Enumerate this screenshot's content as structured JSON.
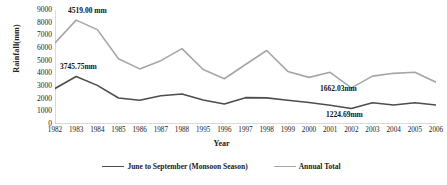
{
  "chart_data": {
    "type": "line",
    "title": "",
    "xlabel": "Year",
    "ylabel": "Rainfall(mm)",
    "ylim": [
      0,
      9000
    ],
    "ytick_step": 1000,
    "yticks": [
      "9000",
      "8000",
      "7000",
      "6000",
      "5000",
      "4000",
      "3000",
      "2000",
      "1000",
      "0"
    ],
    "grid": false,
    "legend_position": "bottom",
    "categories": [
      "1982",
      "1983",
      "1984",
      "1985",
      "1986",
      "1987",
      "1988",
      "1995",
      "1996",
      "1997",
      "1998",
      "1999",
      "2000",
      "2001",
      "2002",
      "2003",
      "2004",
      "2005",
      "2006"
    ],
    "series": [
      {
        "name": "June to September (Monsoon Season)",
        "color": "#4d4d4d",
        "values": [
          2800,
          3745.75,
          3050,
          2050,
          1880,
          2230,
          2370,
          1900,
          1580,
          2080,
          2060,
          1880,
          1700,
          1480,
          1224.69,
          1680,
          1500,
          1680,
          1500
        ]
      },
      {
        "name": "Annual Total",
        "color": "#a6a6a6",
        "values": [
          6400,
          8200,
          7450,
          5150,
          4350,
          5000,
          5950,
          4300,
          3570,
          4700,
          5800,
          4150,
          3680,
          4080,
          2850,
          3780,
          4000,
          4080,
          3300
        ]
      }
    ],
    "annotations": [
      {
        "name": "annual-peak-label",
        "text": "4519.00 mm",
        "x_px": 68,
        "y_px": 6
      },
      {
        "name": "monsoon-peak-label",
        "text": "3745.75mm",
        "x_px": 60,
        "y_px": 62
      },
      {
        "name": "annual-min-label",
        "text": "1662.03mm",
        "x_px": 320,
        "y_px": 84
      },
      {
        "name": "monsoon-min-label",
        "text": "1224.69mm",
        "x_px": 326,
        "y_px": 110
      }
    ]
  },
  "legend": {
    "items": [
      {
        "label": "June to September (Monsoon Season)",
        "color": "#4d4d4d"
      },
      {
        "label": "Annual Total",
        "color": "#a6a6a6"
      }
    ]
  }
}
